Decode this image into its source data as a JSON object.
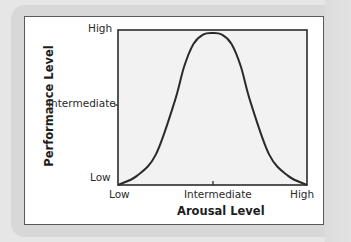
{
  "chart_data": {
    "type": "line",
    "title": "",
    "xlabel": "Arousal Level",
    "ylabel": "Performance Level",
    "x_ticks": [
      "Low",
      "Intermediate",
      "High"
    ],
    "y_ticks": [
      "Low",
      "Intermediate",
      "High"
    ],
    "xlim": [
      0,
      1
    ],
    "ylim": [
      0,
      1
    ],
    "grid": false,
    "legend": null,
    "series": [
      {
        "name": "Performance vs Arousal (inverted-U)",
        "x": [
          0.0,
          0.1,
          0.2,
          0.3,
          0.35,
          0.4,
          0.45,
          0.5,
          0.55,
          0.6,
          0.65,
          0.7,
          0.8,
          0.9,
          1.0
        ],
        "y": [
          0.0,
          0.06,
          0.2,
          0.55,
          0.78,
          0.93,
          0.99,
          1.0,
          0.99,
          0.93,
          0.78,
          0.55,
          0.2,
          0.06,
          0.0
        ]
      }
    ],
    "annotations": []
  },
  "axes": {
    "x_title": "Arousal Level",
    "y_title": "Performance Level",
    "x_tick_low": "Low",
    "x_tick_mid": "Intermediate",
    "x_tick_high": "High",
    "y_tick_low": "Low",
    "y_tick_mid": "Intermediate",
    "y_tick_high": "High"
  },
  "colors": {
    "curve": "#2b2b2b",
    "plot_fill": "#f2f2f2",
    "frame": "#2b2b2b"
  }
}
